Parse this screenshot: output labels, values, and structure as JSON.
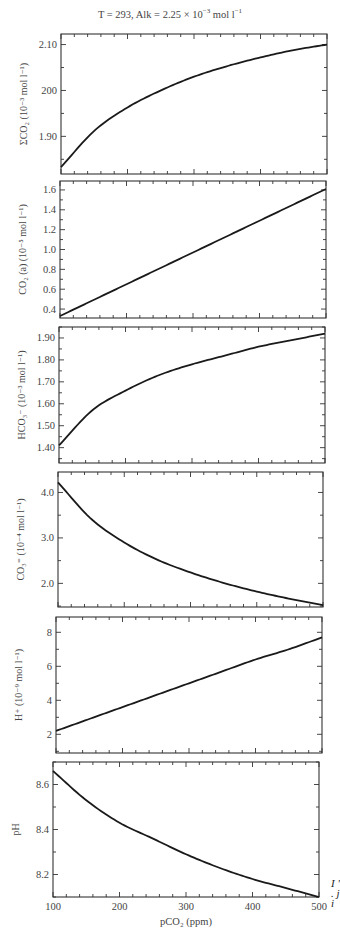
{
  "figure": {
    "title_prefix": "T = 293,    Alk = 2.25 × 10",
    "title_exp": "−3",
    "title_suffix": " mol l",
    "title_exp2": "−1",
    "xlabel": "pCO₂ (ppm)",
    "edge_text": "I ' . j i"
  },
  "colors": {
    "line": "#1a1a1a",
    "axis": "#333333",
    "text": "#444444",
    "background": "#ffffff"
  },
  "chart_data": [
    {
      "type": "line",
      "title": "T = 293, Alk = 2.25 × 10⁻³ mol l⁻¹",
      "ylabel": "ΣCO₂ (10⁻³ mol l⁻¹)",
      "xlabel": "",
      "xlim": [
        100,
        500
      ],
      "ylim": [
        1.818,
        2.123
      ],
      "yticks": [
        1.9,
        2.0,
        2.1
      ],
      "ytick_labels": [
        "1.90",
        "200",
        "2.10"
      ],
      "x": [
        100,
        150,
        200,
        250,
        300,
        350,
        400,
        450,
        500
      ],
      "values": [
        1.833,
        1.912,
        1.963,
        2.0,
        2.03,
        2.053,
        2.072,
        2.088,
        2.1
      ],
      "grid": false
    },
    {
      "type": "line",
      "ylabel": "CO₂ (a) (10⁻⁵ mol l⁻¹)",
      "xlim": [
        100,
        500
      ],
      "ylim": [
        0.31,
        1.69
      ],
      "yticks": [
        0.4,
        0.6,
        0.8,
        1.0,
        1.2,
        1.4,
        1.6
      ],
      "ytick_labels": [
        "0.4",
        "0.6",
        "0.8",
        "1.0",
        "1.2",
        "1.4",
        "1.6"
      ],
      "x": [
        100,
        150,
        200,
        250,
        300,
        350,
        400,
        450,
        500
      ],
      "values": [
        0.33,
        0.49,
        0.65,
        0.81,
        0.97,
        1.13,
        1.29,
        1.45,
        1.61
      ],
      "grid": false
    },
    {
      "type": "line",
      "ylabel": "HCO₃⁻ (10⁻³ mol l⁻¹)",
      "xlim": [
        100,
        500
      ],
      "ylim": [
        1.33,
        1.95
      ],
      "yticks": [
        1.4,
        1.5,
        1.6,
        1.7,
        1.8,
        1.9
      ],
      "ytick_labels": [
        "1.40",
        "1.50",
        "1.60",
        "1.70",
        "1.80",
        "1.90"
      ],
      "x": [
        100,
        150,
        200,
        250,
        300,
        350,
        400,
        450,
        500
      ],
      "values": [
        1.41,
        1.57,
        1.66,
        1.73,
        1.78,
        1.82,
        1.86,
        1.89,
        1.92
      ],
      "grid": false
    },
    {
      "type": "line",
      "ylabel": "CO₃⁼ (10⁻⁴ mol l⁻¹)",
      "xlim": [
        100,
        500
      ],
      "ylim": [
        1.48,
        4.45
      ],
      "yticks": [
        2.0,
        3.0,
        4.0
      ],
      "ytick_labels": [
        "2.0",
        "3.0",
        "4.0"
      ],
      "x": [
        100,
        150,
        200,
        250,
        300,
        350,
        400,
        450,
        500
      ],
      "values": [
        4.22,
        3.42,
        2.9,
        2.52,
        2.24,
        2.01,
        1.82,
        1.66,
        1.52
      ],
      "grid": false
    },
    {
      "type": "line",
      "ylabel": "H⁺ (10⁻⁹ mol l⁻¹)",
      "xlim": [
        100,
        500
      ],
      "ylim": [
        0.9,
        8.9
      ],
      "yticks": [
        2,
        4,
        6,
        8
      ],
      "ytick_labels": [
        "2",
        "4",
        "6",
        "8"
      ],
      "x": [
        100,
        150,
        200,
        250,
        300,
        350,
        400,
        450,
        500
      ],
      "values": [
        2.2,
        2.9,
        3.6,
        4.3,
        5.0,
        5.7,
        6.4,
        7.0,
        7.7
      ],
      "grid": false
    },
    {
      "type": "line",
      "ylabel": "pH",
      "xlabel": "pCO₂ (ppm)",
      "xlim": [
        100,
        500
      ],
      "ylim": [
        8.1,
        8.7
      ],
      "yticks": [
        8.2,
        8.4,
        8.6
      ],
      "ytick_labels": [
        "8.2",
        "8.4",
        "8.6"
      ],
      "xticks": [
        100,
        200,
        300,
        400,
        500
      ],
      "xtick_labels": [
        "100",
        "200",
        "300",
        "400",
        "500"
      ],
      "x": [
        100,
        150,
        200,
        250,
        300,
        350,
        400,
        450,
        500
      ],
      "values": [
        8.66,
        8.53,
        8.43,
        8.36,
        8.29,
        8.23,
        8.18,
        8.14,
        8.1
      ],
      "grid": false
    }
  ]
}
